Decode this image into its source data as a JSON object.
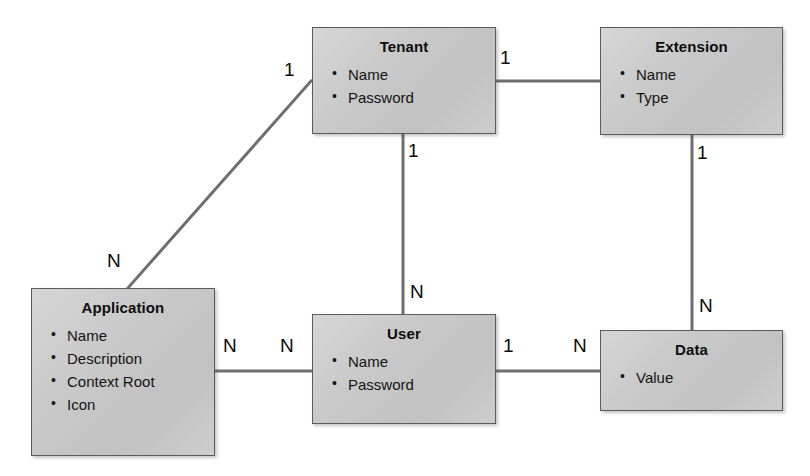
{
  "diagram": {
    "background_color": "#ffffff",
    "box_fill_color": "#c9c9c9",
    "box_border_color": "#5b5b5b",
    "line_color": "#6e6e6e",
    "text_color": "#111111"
  },
  "entities": [
    {
      "id": "tenant",
      "name": "Tenant",
      "attributes": [
        "Name",
        "Password"
      ],
      "x": 312,
      "y": 27,
      "w": 184,
      "h": 107
    },
    {
      "id": "extension",
      "name": "Extension",
      "attributes": [
        "Name",
        "Type"
      ],
      "x": 600,
      "y": 27,
      "w": 183,
      "h": 108
    },
    {
      "id": "application",
      "name": "Application",
      "attributes": [
        "Name",
        "Description",
        "Context Root",
        "Icon"
      ],
      "x": 31,
      "y": 288,
      "w": 184,
      "h": 168
    },
    {
      "id": "user",
      "name": "User",
      "attributes": [
        "Name",
        "Password"
      ],
      "x": 312,
      "y": 314,
      "w": 184,
      "h": 110
    },
    {
      "id": "data",
      "name": "Data",
      "attributes": [
        "Value"
      ],
      "x": 600,
      "y": 330,
      "w": 183,
      "h": 81
    }
  ],
  "relationships": [
    {
      "id": "tenant-application",
      "from": "Tenant",
      "to": "Application",
      "from_cardinality": "1",
      "to_cardinality": "N",
      "kind": "diagonal"
    },
    {
      "id": "tenant-extension",
      "from": "Tenant",
      "to": "Extension",
      "from_cardinality": "1",
      "to_cardinality": "",
      "kind": "horizontal"
    },
    {
      "id": "tenant-user",
      "from": "Tenant",
      "to": "User",
      "from_cardinality": "1",
      "to_cardinality": "N",
      "kind": "vertical"
    },
    {
      "id": "extension-data",
      "from": "Extension",
      "to": "Data",
      "from_cardinality": "1",
      "to_cardinality": "N",
      "kind": "vertical"
    },
    {
      "id": "application-user",
      "from": "Application",
      "to": "User",
      "from_cardinality": "N",
      "to_cardinality": "N",
      "kind": "horizontal"
    },
    {
      "id": "user-data",
      "from": "User",
      "to": "Data",
      "from_cardinality": "1",
      "to_cardinality": "N",
      "kind": "horizontal"
    }
  ],
  "cardinality_labels": [
    {
      "id": "tenant-ext-1",
      "text": "1",
      "x": 500,
      "y": 48
    },
    {
      "id": "tenant-app-1",
      "text": "1",
      "x": 284,
      "y": 60
    },
    {
      "id": "tenant-user-1",
      "text": "1",
      "x": 408,
      "y": 141
    },
    {
      "id": "ext-data-1",
      "text": "1",
      "x": 697,
      "y": 143
    },
    {
      "id": "tenant-app-n",
      "text": "N",
      "x": 107,
      "y": 251
    },
    {
      "id": "tenant-user-n",
      "text": "N",
      "x": 410,
      "y": 282
    },
    {
      "id": "ext-data-n",
      "text": "N",
      "x": 699,
      "y": 296
    },
    {
      "id": "app-user-n-a",
      "text": "N",
      "x": 223,
      "y": 336
    },
    {
      "id": "app-user-n-b",
      "text": "N",
      "x": 280,
      "y": 336
    },
    {
      "id": "user-data-1",
      "text": "1",
      "x": 503,
      "y": 336
    },
    {
      "id": "user-data-n",
      "text": "N",
      "x": 573,
      "y": 336
    }
  ]
}
